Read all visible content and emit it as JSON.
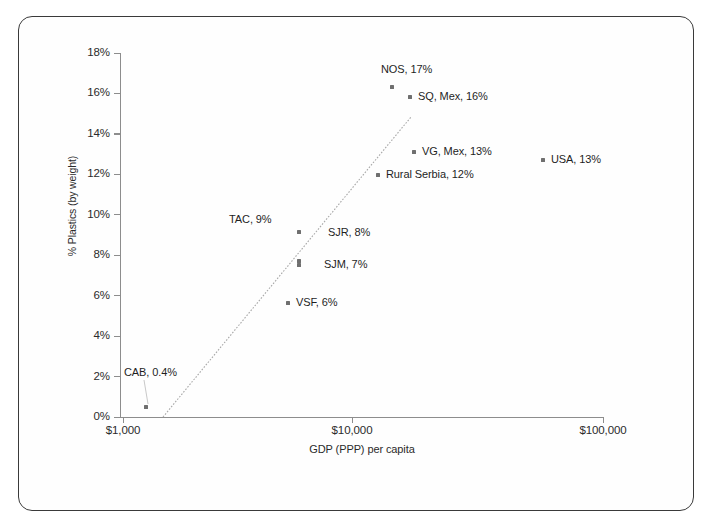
{
  "chart_data": {
    "type": "scatter",
    "title": "",
    "xlabel": "GDP (PPP) per capita",
    "ylabel": "% Plastics (by weight)",
    "x_scale": "log",
    "x_ticks": [
      "$1,000",
      "$10,000",
      "$100,000"
    ],
    "x_tick_values": [
      1000,
      10000,
      100000
    ],
    "xlim": [
      1000,
      100000
    ],
    "y_ticks": [
      "0%",
      "2%",
      "4%",
      "6%",
      "8%",
      "10%",
      "12%",
      "14%",
      "16%",
      "18%"
    ],
    "y_tick_values": [
      0,
      2,
      4,
      6,
      8,
      10,
      12,
      14,
      16,
      18
    ],
    "ylim": [
      0,
      18
    ],
    "grid": false,
    "legend": "none",
    "trendline": true,
    "points": [
      {
        "label": "CAB, 0.4%",
        "name": "CAB",
        "x": 1200,
        "y": 0.4,
        "px": 146,
        "py": 407,
        "lx": 124,
        "ly": 366,
        "leader": true
      },
      {
        "label": "VSF, 6%",
        "name": "VSF",
        "x": 4200,
        "y": 5.7,
        "px": 288,
        "py": 303,
        "lx": 296,
        "ly": 296,
        "leader": false
      },
      {
        "label": "SJM, 7%",
        "name": "SJM",
        "x": 5000,
        "y": 7.3,
        "px": 299,
        "py": 265,
        "lx": 324,
        "ly": 258,
        "leader": false
      },
      {
        "label": "SJR, 8%",
        "name": "SJR",
        "x": 5000,
        "y": 8.6,
        "px": 299,
        "py": 232,
        "lx": 328,
        "ly": 226,
        "leader": false
      },
      {
        "label": "TAC, 9%",
        "name": "TAC",
        "x": 5000,
        "y": 9.0,
        "px": 299,
        "py": 232,
        "lx": 229,
        "ly": 213,
        "leader": false
      },
      {
        "label": "Rural Serbia, 12%",
        "name": "Rural Serbia",
        "x": 8600,
        "y": 12.0,
        "px": 378,
        "py": 175,
        "lx": 386,
        "ly": 168,
        "leader": false
      },
      {
        "label": "VG, Mex, 13%",
        "name": "VG, Mex",
        "x": 11500,
        "y": 13.0,
        "px": 414,
        "py": 152,
        "lx": 422,
        "ly": 145,
        "leader": false
      },
      {
        "label": "USA, 13%",
        "name": "USA",
        "x": 55000,
        "y": 12.8,
        "px": 543,
        "py": 160,
        "lx": 551,
        "ly": 153,
        "leader": false
      },
      {
        "label": "SQ, Mex, 16%",
        "name": "SQ, Mex",
        "x": 11300,
        "y": 16.2,
        "px": 410,
        "py": 97,
        "lx": 418,
        "ly": 90,
        "leader": false
      },
      {
        "label": "NOS, 17%",
        "name": "NOS",
        "x": 10200,
        "y": 16.4,
        "px": 392,
        "py": 87,
        "lx": 381,
        "ly": 63,
        "leader": false
      }
    ],
    "trendline_segment": {
      "x1": 163,
      "y1": 417,
      "x2": 411,
      "y2": 117
    },
    "colors": {
      "axis": "#8d8d8d",
      "marker": "#6f6f6f",
      "text": "#1f1f1f",
      "trendline": "#a8a8a8",
      "frame": "#3a3a3a",
      "background": "#ffffff"
    }
  }
}
